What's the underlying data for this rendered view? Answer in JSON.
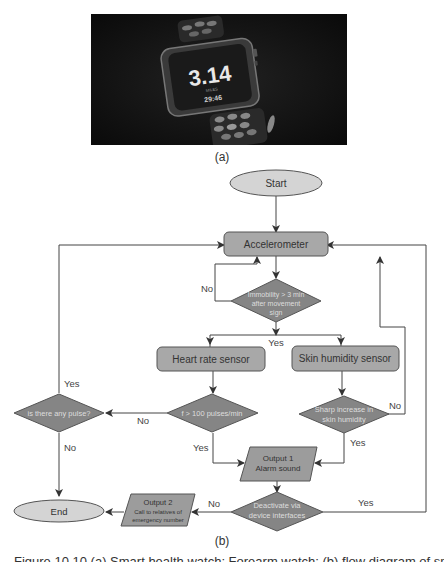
{
  "panel_a": {
    "watch_display": {
      "value": "3.14",
      "unit": "MILES",
      "time": "29:46"
    },
    "label": "(a)"
  },
  "panel_b": {
    "label": "(b)",
    "nodes": {
      "start": "Start",
      "accelerometer": "Accelerometer",
      "immobility_l1": "Immobility > 3 min",
      "immobility_l2": "after movement",
      "immobility_l3": "sign",
      "heart_rate": "Heart rate sensor",
      "skin_humidity": "Skin humidity sensor",
      "pulse_check": "is there any pulse?",
      "pulse_threshold": "f > 100 pulses/min",
      "sharp_l1": "Sharp increase in",
      "sharp_l2": "skin humidity",
      "output1_l1": "Output 1",
      "output1_l2": "Alarm sound",
      "deactivate_l1": "Deactivate via",
      "deactivate_l2": "device interfaces",
      "output2_l1": "Output 2",
      "output2_l2": "Call to relatives of",
      "output2_l3": "emergency number",
      "end": "End"
    },
    "edge_labels": {
      "immobility_no": "No",
      "immobility_yes": "Yes",
      "pulse_yes": "Yes",
      "pulse_no": "No",
      "threshold_no": "No",
      "threshold_yes": "Yes",
      "sharp_no": "No",
      "sharp_yes": "Yes",
      "deactivate_no": "No",
      "deactivate_yes": "Yes"
    },
    "colors": {
      "process": "#a8a8a8",
      "decision": "#858585",
      "terminal": "#d4d4d4",
      "io": "#9c9c9c",
      "line": "#444444"
    }
  },
  "figure_caption": "Figure 10.10  (a) Smart health watch; Forearm watch; (b) flow diagram of smart health watch"
}
